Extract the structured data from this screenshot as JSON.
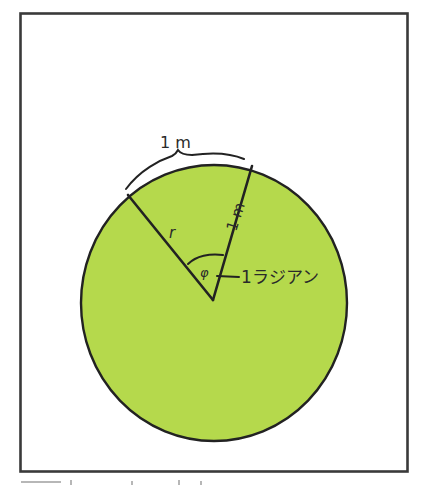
{
  "diagram": {
    "colors": {
      "background": "#ffffff",
      "frame": "#3a3a3a",
      "disk_fill": "#b5d94c",
      "stroke": "#222222"
    },
    "labels": {
      "arc_length": "1 m",
      "radius_left": "r",
      "radius_right": "1 m",
      "angle_symbol": "φ",
      "angle_callout": "1ラジアン"
    }
  }
}
